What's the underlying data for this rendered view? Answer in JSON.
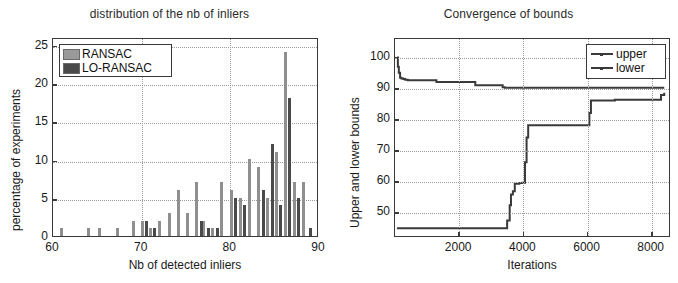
{
  "figure": {
    "background": "#ffffff",
    "axis_color": "#3a3a3a",
    "grid_color": "#9a9a9a"
  },
  "chart_data": [
    {
      "id": "histogram-inliers",
      "type": "bar",
      "title": "distribution of the nb of inliers",
      "xlabel": "Nb of detected inliers",
      "ylabel": "percentage of experiments",
      "xlim": [
        60,
        90
      ],
      "ylim": [
        0,
        26
      ],
      "xticks": [
        60,
        70,
        80,
        90
      ],
      "xticklabels": [
        "60",
        "70",
        "80",
        "90"
      ],
      "yticks": [
        0,
        5,
        10,
        15,
        20,
        25
      ],
      "yticklabels": [
        "0",
        "5",
        "10",
        "15",
        "20",
        "25"
      ],
      "grid": true,
      "legend": {
        "position": "upper-left",
        "entries": [
          {
            "label": "RANSAC",
            "color": "#9a9a9a"
          },
          {
            "label": "LO-RANSAC",
            "color": "#4a4a4a"
          }
        ]
      },
      "series": [
        {
          "name": "RANSAC",
          "color": "#8f8f8f",
          "points": [
            {
              "x": 61.0,
              "y": 1
            },
            {
              "x": 64.0,
              "y": 1
            },
            {
              "x": 65.2,
              "y": 1
            },
            {
              "x": 67.3,
              "y": 1
            },
            {
              "x": 69.1,
              "y": 2
            },
            {
              "x": 70.1,
              "y": 2
            },
            {
              "x": 71.0,
              "y": 1
            },
            {
              "x": 72.0,
              "y": 2
            },
            {
              "x": 73.1,
              "y": 3
            },
            {
              "x": 74.2,
              "y": 6
            },
            {
              "x": 75.2,
              "y": 3
            },
            {
              "x": 76.2,
              "y": 7
            },
            {
              "x": 77.0,
              "y": 2
            },
            {
              "x": 78.0,
              "y": 1
            },
            {
              "x": 79.0,
              "y": 7
            },
            {
              "x": 80.1,
              "y": 6
            },
            {
              "x": 81.1,
              "y": 5
            },
            {
              "x": 82.2,
              "y": 10
            },
            {
              "x": 83.2,
              "y": 9
            },
            {
              "x": 84.2,
              "y": 5
            },
            {
              "x": 85.2,
              "y": 11
            },
            {
              "x": 86.2,
              "y": 24
            },
            {
              "x": 87.2,
              "y": 7
            },
            {
              "x": 88.2,
              "y": 7
            }
          ]
        },
        {
          "name": "LO-RANSAC",
          "color": "#4a4a4a",
          "points": [
            {
              "x": 70.6,
              "y": 2
            },
            {
              "x": 71.5,
              "y": 1
            },
            {
              "x": 76.7,
              "y": 2
            },
            {
              "x": 77.5,
              "y": 1
            },
            {
              "x": 78.6,
              "y": 1
            },
            {
              "x": 80.6,
              "y": 5
            },
            {
              "x": 81.6,
              "y": 4
            },
            {
              "x": 83.7,
              "y": 6
            },
            {
              "x": 84.7,
              "y": 12
            },
            {
              "x": 85.7,
              "y": 4
            },
            {
              "x": 86.7,
              "y": 18
            },
            {
              "x": 87.7,
              "y": 5
            },
            {
              "x": 89.0,
              "y": 1
            }
          ]
        }
      ]
    },
    {
      "id": "convergence-bounds",
      "type": "line",
      "title": "Convergence of bounds",
      "xlabel": "Iterations",
      "ylabel": "Upper and lower bounds",
      "xlim": [
        0,
        8600
      ],
      "ylim": [
        42,
        106
      ],
      "xticks": [
        2000,
        4000,
        6000,
        8000
      ],
      "xticklabels": [
        "2000",
        "4000",
        "6000",
        "8000"
      ],
      "yticks": [
        50,
        60,
        70,
        80,
        90,
        100
      ],
      "yticklabels": [
        "50",
        "60",
        "70",
        "80",
        "90",
        "100"
      ],
      "grid": true,
      "legend": {
        "position": "upper-right",
        "entries": [
          {
            "label": "upper",
            "color": "#3a3a3a"
          },
          {
            "label": "lower",
            "color": "#3a3a3a"
          }
        ]
      },
      "series": [
        {
          "name": "upper",
          "color": "#3a3a3a",
          "x": [
            60,
            90,
            120,
            160,
            200,
            260,
            320,
            400,
            1250,
            1300,
            2450,
            2520,
            3300,
            3380,
            3450,
            8450
          ],
          "y": [
            100,
            97,
            95,
            93.4,
            93.2,
            93.0,
            92.8,
            92.6,
            92.6,
            92.0,
            92.0,
            91.0,
            91.0,
            90.3,
            90.2,
            90.2
          ]
        },
        {
          "name": "lower",
          "color": "#3a3a3a",
          "x": [
            60,
            3480,
            3520,
            3600,
            3640,
            3700,
            3760,
            3900,
            4000,
            4080,
            4130,
            4180,
            6050,
            6100,
            6150,
            6850,
            6900,
            8350,
            8450
          ],
          "y": [
            44.5,
            44.5,
            47,
            52,
            55.5,
            56.5,
            59.0,
            59.2,
            59.3,
            66,
            74,
            78,
            78,
            82,
            86,
            86,
            86.3,
            87.8,
            88.5
          ]
        }
      ]
    }
  ]
}
